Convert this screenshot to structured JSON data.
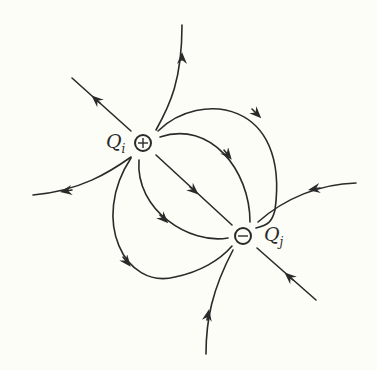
{
  "diagram": {
    "background": "#fdfdf8",
    "stroke_color": "#2a2a2a",
    "charges": [
      {
        "id": "Qi",
        "label": "Q",
        "subscript": "i",
        "sign": "+",
        "symbol": "⊕",
        "cx": 143,
        "cy": 143,
        "r": 8
      },
      {
        "id": "Qj",
        "label": "Q",
        "subscript": "j",
        "sign": "-",
        "symbol": "⊖",
        "cx": 243,
        "cy": 236,
        "r": 8
      }
    ],
    "field_lines": [
      {
        "name": "outward-up",
        "from": "Qi",
        "direction": "outward"
      },
      {
        "name": "outward-upper-left",
        "from": "Qi",
        "direction": "outward"
      },
      {
        "name": "outward-left",
        "from": "Qi",
        "direction": "outward"
      },
      {
        "name": "inward-right",
        "to": "Qj",
        "direction": "inward"
      },
      {
        "name": "inward-lower-right",
        "to": "Qj",
        "direction": "inward"
      },
      {
        "name": "inward-bottom",
        "to": "Qj",
        "direction": "inward"
      },
      {
        "name": "connecting-straight",
        "from": "Qi",
        "to": "Qj"
      },
      {
        "name": "connecting-upper-inner-arc",
        "from": "Qi",
        "to": "Qj"
      },
      {
        "name": "connecting-upper-outer-arc",
        "from": "Qi",
        "to": "Qj"
      },
      {
        "name": "connecting-lower-inner-arc",
        "from": "Qi",
        "to": "Qj"
      },
      {
        "name": "connecting-lower-outer-arc",
        "from": "Qi",
        "to": "Qj"
      }
    ]
  }
}
